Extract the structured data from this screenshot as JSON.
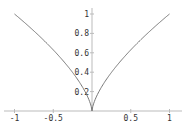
{
  "chart_data": {
    "type": "line",
    "title": "",
    "xlabel": "",
    "ylabel": "",
    "function": "y = |x|^(2/3)",
    "xlim": [
      -1,
      1
    ],
    "ylim": [
      0,
      1
    ],
    "grid": false,
    "legend": null,
    "x_ticks": [
      "-1",
      "-0.5",
      "0.5",
      "1"
    ],
    "y_ticks": [
      "0.2",
      "0.4",
      "0.6",
      "0.8",
      "1"
    ],
    "series": [
      {
        "name": "curve",
        "x": [
          -1,
          -0.8,
          -0.6,
          -0.5,
          -0.4,
          -0.2,
          -0.1,
          -0.02,
          0,
          0.02,
          0.1,
          0.2,
          0.4,
          0.5,
          0.6,
          0.8,
          1
        ],
        "values": [
          1,
          0.86,
          0.71,
          0.63,
          0.54,
          0.34,
          0.22,
          0.07,
          0,
          0.07,
          0.22,
          0.34,
          0.54,
          0.63,
          0.71,
          0.86,
          1
        ]
      }
    ],
    "colors": {
      "curve": "#777777",
      "axis": "#bbbbbb",
      "text": "#333333"
    }
  }
}
